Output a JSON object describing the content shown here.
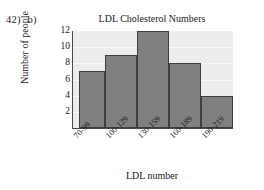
{
  "question": {
    "number": "42)",
    "part": "b)"
  },
  "chart_data": {
    "type": "bar",
    "title": "LDL Cholesterol Numbers",
    "xlabel": "LDL number",
    "ylabel": "Number of people",
    "categories": [
      "70-99",
      "100-129",
      "130-159",
      "160-189",
      "190-219"
    ],
    "values": [
      7,
      9,
      12,
      8,
      4
    ],
    "ylim": [
      0,
      12
    ],
    "yticks": [
      2,
      4,
      6,
      8,
      10,
      12
    ],
    "grid": true,
    "legend": false,
    "colors": {
      "bar_fill": "#808080",
      "bar_edge": "#3f3f3f",
      "plot_background": "#ededed",
      "gridline": "#fafafa",
      "axis": "#4a4a4a",
      "text": "#1a1a1a"
    }
  }
}
